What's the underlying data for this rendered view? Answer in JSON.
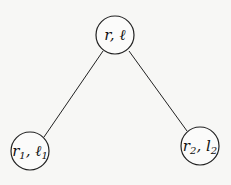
{
  "diagram": {
    "type": "tree",
    "root": {
      "label_main": "r",
      "label_sep": ", ",
      "label_second": "ℓ",
      "sub": ""
    },
    "children": [
      {
        "label_main": "r",
        "sub1": "1",
        "label_sep": ", ",
        "label_second": "ℓ",
        "sub2": "1"
      },
      {
        "label_main": "r",
        "sub1": "2",
        "label_sep": ", ",
        "label_second": "l",
        "sub2": "2"
      }
    ],
    "edges": [
      {
        "from": "root",
        "to": "child-1"
      },
      {
        "from": "root",
        "to": "child-2"
      }
    ],
    "colors": {
      "stroke": "#222222",
      "background": "#f7f7f5"
    }
  }
}
